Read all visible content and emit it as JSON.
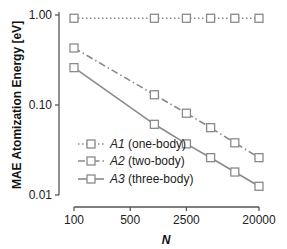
{
  "chart_data": {
    "type": "line",
    "title": "",
    "xlabel": "N",
    "ylabel": "MAE Atomization Energy [eV]",
    "xscale": "log",
    "yscale": "log",
    "xlim": [
      100,
      20000
    ],
    "ylim": [
      0.01,
      1.0
    ],
    "x_ticks": [
      100,
      500,
      2500,
      20000
    ],
    "x_tick_labels": [
      "100",
      "500",
      "2500",
      "20000"
    ],
    "y_ticks": [
      0.01,
      0.1,
      1.0
    ],
    "y_tick_labels": [
      "0.01",
      "0.10",
      "1.00"
    ],
    "grid": false,
    "legend_position": "lower left",
    "x": [
      100,
      1000,
      2500,
      5000,
      10000,
      20000
    ],
    "series": [
      {
        "name": "A1 (one-body)",
        "label_italic": "A1",
        "label_rest": " (one-body)",
        "linestyle": "dotted",
        "marker": "square",
        "color": "#8a8a8a",
        "values": [
          0.92,
          0.92,
          0.92,
          0.92,
          0.92,
          0.92
        ]
      },
      {
        "name": "A2 (two-body)",
        "label_italic": "A2",
        "label_rest": " (two-body)",
        "linestyle": "dashdot",
        "marker": "square",
        "color": "#8a8a8a",
        "values": [
          0.43,
          0.13,
          0.081,
          0.056,
          0.038,
          0.026
        ]
      },
      {
        "name": "A3 (three-body)",
        "label_italic": "A3",
        "label_rest": " (three-body)",
        "linestyle": "solid",
        "marker": "square",
        "color": "#8a8a8a",
        "values": [
          0.26,
          0.061,
          0.037,
          0.026,
          0.018,
          0.0125
        ]
      }
    ]
  }
}
